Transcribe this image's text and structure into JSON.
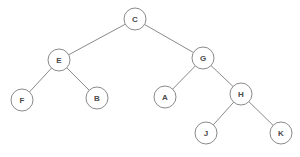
{
  "diagram": {
    "type": "binary-tree",
    "background_color": "#ffffff",
    "stroke_color": "#8a8a8a",
    "label_color": "#4a4a4a",
    "node_radius": 11,
    "nodes": [
      {
        "id": "C",
        "label": "C",
        "x": 135,
        "y": 19,
        "role": "root",
        "depth": 0
      },
      {
        "id": "E",
        "label": "E",
        "x": 59,
        "y": 60,
        "role": "internal",
        "depth": 1
      },
      {
        "id": "G",
        "label": "G",
        "x": 203,
        "y": 58,
        "role": "internal",
        "depth": 1
      },
      {
        "id": "F",
        "label": "F",
        "x": 22,
        "y": 100,
        "role": "leaf",
        "depth": 2
      },
      {
        "id": "B",
        "label": "B",
        "x": 97,
        "y": 98,
        "role": "leaf",
        "depth": 2
      },
      {
        "id": "A",
        "label": "A",
        "x": 165,
        "y": 97,
        "role": "leaf",
        "depth": 2
      },
      {
        "id": "H",
        "label": "H",
        "x": 241,
        "y": 94,
        "role": "internal",
        "depth": 2
      },
      {
        "id": "J",
        "label": "J",
        "x": 206,
        "y": 133,
        "role": "leaf",
        "depth": 3
      },
      {
        "id": "K",
        "label": "K",
        "x": 281,
        "y": 133,
        "role": "leaf",
        "depth": 3
      }
    ],
    "edges": [
      {
        "from": "C",
        "to": "E",
        "side": "left"
      },
      {
        "from": "C",
        "to": "G",
        "side": "right"
      },
      {
        "from": "E",
        "to": "F",
        "side": "left"
      },
      {
        "from": "E",
        "to": "B",
        "side": "right"
      },
      {
        "from": "G",
        "to": "A",
        "side": "left"
      },
      {
        "from": "G",
        "to": "H",
        "side": "right"
      },
      {
        "from": "H",
        "to": "J",
        "side": "left"
      },
      {
        "from": "H",
        "to": "K",
        "side": "right"
      }
    ]
  }
}
